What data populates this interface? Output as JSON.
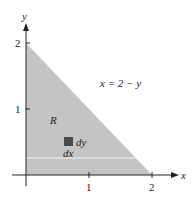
{
  "diagram": {
    "region_label": "R",
    "boundary_label": "x = 2 − y",
    "element_labels": {
      "dy": "dy",
      "dx": "dx"
    },
    "axes": {
      "x_label": "x",
      "y_label": "y",
      "x_ticks": [
        "1",
        "2"
      ],
      "y_ticks": [
        "1",
        "2"
      ]
    },
    "colors": {
      "region_fill": "#c4c4c4",
      "element_fill": "#4a4a4a",
      "axis": "#222222",
      "strip": "#f2f2f2"
    }
  }
}
